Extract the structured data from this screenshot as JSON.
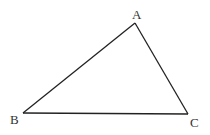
{
  "diagram": {
    "type": "triangle",
    "stroke_color": "#222222",
    "vertices": [
      {
        "label": "A",
        "x": 135,
        "y": 23,
        "label_x": 132,
        "label_y": 19
      },
      {
        "label": "B",
        "x": 23,
        "y": 113,
        "label_x": 10,
        "label_y": 124
      },
      {
        "label": "C",
        "x": 188,
        "y": 114,
        "label_x": 190,
        "label_y": 127
      }
    ],
    "edges": [
      [
        "A",
        "B"
      ],
      [
        "B",
        "C"
      ],
      [
        "C",
        "A"
      ]
    ]
  }
}
